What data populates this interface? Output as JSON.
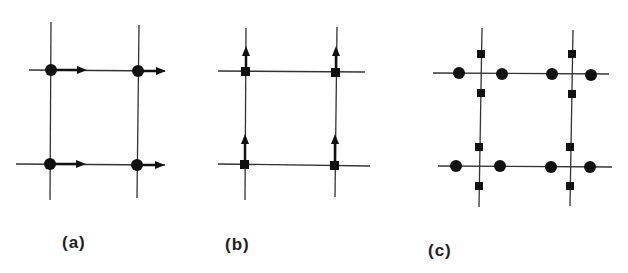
{
  "figure": {
    "panels": [
      {
        "id": "a",
        "label": "(a)",
        "site_marker": "circle",
        "moment_marker": "arrow-right",
        "description": "Square lattice with circular sites at each intersection, each carrying a rightward arrow"
      },
      {
        "id": "b",
        "label": "(b)",
        "site_marker": "square",
        "moment_marker": "arrow-up",
        "description": "Square lattice with square sites at each intersection, each carrying an upward arrow"
      },
      {
        "id": "c",
        "label": "(c)",
        "site_marker": "circle+square",
        "moment_marker": "none",
        "description": "Square lattice with circles on horizontal bonds either side of each intersection and squares on vertical bonds above/below"
      }
    ],
    "colors": {
      "line": "#333333",
      "marker": "#111111",
      "background": "#ffffff"
    }
  }
}
